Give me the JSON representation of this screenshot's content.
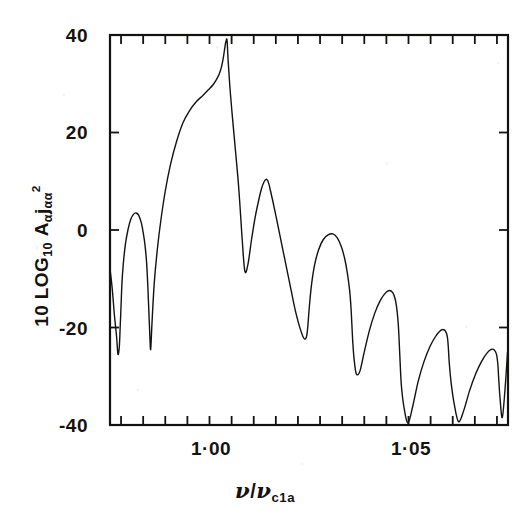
{
  "chart_data": {
    "type": "line",
    "title": "",
    "subtitle": "",
    "xlabel_parts": {
      "numerator": "ν",
      "slash": "/",
      "denominator": "ν",
      "denominator_sub": "c1a"
    },
    "xlabel": "ν/ν_c1a",
    "ylabel": "10 LOG₁₀ Aα jαα²",
    "ylabel_parts": {
      "lead": "10 LOG",
      "lead_sub": "10",
      "symbol_a": "A",
      "sub_a": "α",
      "symbol_j": "j",
      "sub_j": "αα",
      "power": "2"
    },
    "xlim": [
      0.9825,
      1.0725
    ],
    "ylim": [
      -40,
      40
    ],
    "ytick_values": [
      40,
      20,
      0,
      -20,
      -40
    ],
    "ytick_labels": [
      "40",
      "20",
      "0",
      "-20",
      "-40"
    ],
    "xtick_values": [
      0.985,
      0.99,
      0.995,
      1.0,
      1.005,
      1.01,
      1.015,
      1.02,
      1.025,
      1.03,
      1.035,
      1.04,
      1.045,
      1.05,
      1.055,
      1.06,
      1.065,
      1.07
    ],
    "xtick_labeled": [
      {
        "value": 1.0,
        "label": "1·00"
      },
      {
        "value": 1.05,
        "label": "1·05"
      }
    ],
    "grid": false,
    "legend": null,
    "frame": "box",
    "tick_direction": "in",
    "line_color": "#141210",
    "line_width": 1.4,
    "series": [
      {
        "name": "Aα jαα squared response",
        "x": [
          0.9825,
          0.983,
          0.9835,
          0.984,
          0.9843,
          0.9846,
          0.9848,
          0.985,
          0.9852,
          0.9855,
          0.986,
          0.9866,
          0.9872,
          0.9878,
          0.9884,
          0.989,
          0.9896,
          0.99,
          0.9904,
          0.9908,
          0.9911,
          0.9913,
          0.9915,
          0.9917,
          0.992,
          0.9925,
          0.9932,
          0.994,
          0.995,
          0.9962,
          0.9975,
          0.999,
          1.0005,
          1.002,
          1.0035,
          1.0048,
          1.0058,
          1.0066,
          1.0072,
          1.0077,
          1.0081,
          1.0084,
          1.0086,
          1.0088,
          1.0089,
          1.009,
          1.0092,
          1.0096,
          1.0101,
          1.0106,
          1.011,
          1.0114,
          1.0117,
          1.012,
          1.0124,
          1.013,
          1.0137,
          1.0145,
          1.0153,
          1.0161,
          1.0168,
          1.0174,
          1.0178,
          1.0181,
          1.0183,
          1.0185,
          1.0188,
          1.0193,
          1.02,
          1.0209,
          1.0218,
          1.0227,
          1.0236,
          1.0244,
          1.0251,
          1.0257,
          1.0262,
          1.0266,
          1.0269,
          1.0271,
          1.0273,
          1.0276,
          1.0281,
          1.0288,
          1.0297,
          1.0307,
          1.0318,
          1.0329,
          1.0339,
          1.0348,
          1.0356,
          1.0362,
          1.0367,
          1.037,
          1.0372,
          1.0374,
          1.0377,
          1.0382,
          1.039,
          1.04,
          1.0412,
          1.0424,
          1.0436,
          1.0447,
          1.0456,
          1.0464,
          1.047,
          1.0474,
          1.0477,
          1.0479,
          1.0481,
          1.0484,
          1.049,
          1.0499,
          1.051,
          1.0522,
          1.0535,
          1.0548,
          1.056,
          1.057,
          1.0578,
          1.0584,
          1.0588,
          1.059,
          1.0592,
          1.0596,
          1.0603,
          1.0613,
          1.0625,
          1.0638,
          1.0652,
          1.0665,
          1.0677,
          1.0687,
          1.0694,
          1.0699,
          1.0702,
          1.0704,
          1.0707,
          1.0712,
          1.0718,
          1.0724
        ],
        "y": [
          -8.0,
          -12.0,
          -17.5,
          -22.0,
          -25.5,
          -24.0,
          -20.0,
          -15.5,
          -11.0,
          -7.0,
          -2.8,
          0.2,
          2.2,
          3.2,
          3.5,
          3.0,
          1.4,
          -0.5,
          -3.0,
          -7.0,
          -12.5,
          -17.0,
          -21.5,
          -24.5,
          -19.0,
          -11.0,
          -4.0,
          2.0,
          8.0,
          13.5,
          18.0,
          22.0,
          24.5,
          26.3,
          27.6,
          28.8,
          29.8,
          30.9,
          32.0,
          33.4,
          35.2,
          37.0,
          38.2,
          38.9,
          39.2,
          38.6,
          35.0,
          29.5,
          24.0,
          19.0,
          15.0,
          11.0,
          7.5,
          3.5,
          -2.0,
          -8.5,
          -7.0,
          -2.0,
          2.5,
          6.0,
          8.6,
          10.0,
          10.4,
          10.2,
          9.8,
          9.2,
          8.0,
          6.0,
          3.0,
          -1.0,
          -5.0,
          -9.0,
          -13.0,
          -16.5,
          -19.0,
          -20.8,
          -22.0,
          -22.4,
          -22.0,
          -21.0,
          -19.0,
          -15.5,
          -11.0,
          -7.0,
          -4.0,
          -2.0,
          -1.0,
          -0.8,
          -1.6,
          -3.4,
          -6.0,
          -9.0,
          -12.5,
          -16.0,
          -19.5,
          -23.0,
          -26.5,
          -29.5,
          -29.0,
          -25.0,
          -20.5,
          -17.0,
          -14.5,
          -13.0,
          -12.4,
          -12.8,
          -14.2,
          -16.5,
          -19.5,
          -23.0,
          -27.0,
          -32.0,
          -36.5,
          -39.6,
          -36.0,
          -31.0,
          -27.0,
          -24.0,
          -22.0,
          -20.8,
          -20.4,
          -20.8,
          -22.0,
          -24.0,
          -27.0,
          -31.0,
          -35.5,
          -39.3,
          -37.0,
          -33.0,
          -29.5,
          -27.0,
          -25.3,
          -24.5,
          -24.6,
          -25.5,
          -27.5,
          -30.5,
          -34.5,
          -38.5,
          -33.0,
          -25.0
        ]
      }
    ]
  },
  "axis": {
    "ytick_labels": [
      "40",
      "20",
      "0",
      "-20",
      "-40"
    ]
  }
}
